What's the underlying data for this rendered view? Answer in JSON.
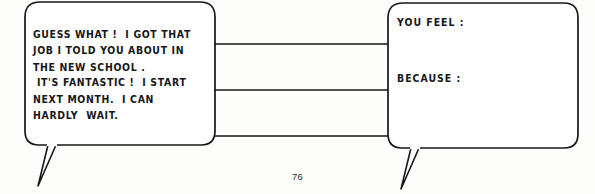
{
  "page": {
    "number": "76",
    "ink_color": "#17171a",
    "paper_color": "#fdfdfc"
  },
  "left_bubble": {
    "name": "speech-bubble-left",
    "text": "GUESS WHAT !  I GOT THAT\nJOB I TOLD YOU ABOUT IN\nTHE NEW SCHOOL .\n IT'S FANTASTIC !  I START\nNEXT MONTH.  I CAN\nHARDLY  WAIT."
  },
  "right_bubble": {
    "name": "speech-bubble-right",
    "prompt_feel": "YOU FEEL :",
    "prompt_because": "BECAUSE :"
  },
  "connectors": {
    "count": 3,
    "label": "connector-lines"
  }
}
